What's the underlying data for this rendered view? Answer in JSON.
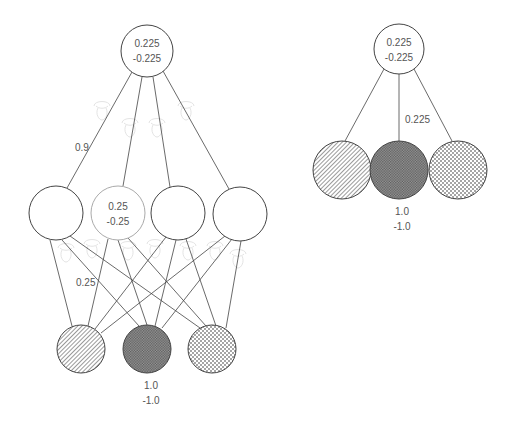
{
  "left_network": {
    "output_node": {
      "cx": 147,
      "cy": 51,
      "r": 26,
      "value_pos": "0.225",
      "value_neg": "-0.225"
    },
    "hidden_nodes": [
      {
        "cx": 56,
        "cy": 213,
        "r": 27,
        "highlighted": false,
        "value_pos": "",
        "value_neg": ""
      },
      {
        "cx": 118,
        "cy": 213,
        "r": 27,
        "highlighted": true,
        "value_pos": "0.25",
        "value_neg": "-0.25"
      },
      {
        "cx": 178,
        "cy": 213,
        "r": 27,
        "highlighted": false,
        "value_pos": "",
        "value_neg": ""
      },
      {
        "cx": 240,
        "cy": 214,
        "r": 27,
        "highlighted": false,
        "value_pos": "",
        "value_neg": ""
      }
    ],
    "input_nodes": [
      {
        "cx": 81,
        "cy": 349,
        "r": 24,
        "pattern": "diagonal-hatch"
      },
      {
        "cx": 147,
        "cy": 349,
        "r": 24,
        "pattern": "cross-hatch"
      },
      {
        "cx": 212,
        "cy": 349,
        "r": 24,
        "pattern": "dots"
      }
    ],
    "weight_label_output": "0.9",
    "weight_label_hidden": "0.25",
    "input_value_pos": "1.0",
    "input_value_neg": "-1.0"
  },
  "right_network": {
    "output_node": {
      "cx": 399,
      "cy": 49,
      "r": 25,
      "value_pos": "0.225",
      "value_neg": "-0.225"
    },
    "input_nodes": [
      {
        "cx": 342,
        "cy": 170,
        "r": 29,
        "pattern": "diagonal-hatch"
      },
      {
        "cx": 399,
        "cy": 170,
        "r": 29,
        "pattern": "cross-hatch"
      },
      {
        "cx": 458,
        "cy": 170,
        "r": 29,
        "pattern": "dots"
      }
    ],
    "weight_label": "0.225",
    "input_value_pos": "1.0",
    "input_value_neg": "-1.0"
  },
  "colors": {
    "stroke": "#444444",
    "light_stroke": "#aaaaaa",
    "text": "#555555",
    "ghost": "#e4e4e4"
  }
}
